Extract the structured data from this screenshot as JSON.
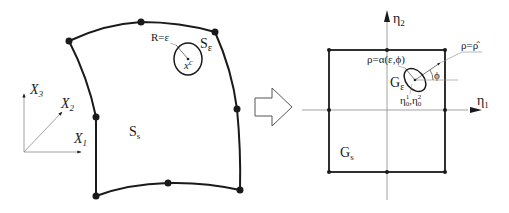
{
  "diagram": {
    "left_panel": {
      "name": "physical-surface",
      "surface_label": {
        "main": "S",
        "sub": "s"
      },
      "singular_region_label": {
        "main": "S",
        "sub": "ε"
      },
      "radius_label": "R=ε",
      "source_point_label": {
        "main": "x",
        "sup": "c"
      },
      "axes": {
        "x1": {
          "main": "X",
          "sub": "1"
        },
        "x2": {
          "main": "X",
          "sub": "2"
        },
        "x3": {
          "main": "X",
          "sub": "3"
        }
      },
      "node_count": 8
    },
    "transform_arrow": {
      "name": "mapping-arrow"
    },
    "right_panel": {
      "name": "parametric-square",
      "axis_h": {
        "main": "η",
        "sub": "1"
      },
      "axis_v": {
        "main": "η",
        "sub": "2"
      },
      "square_label": {
        "main": "G",
        "sub": "s"
      },
      "singular_region_label": {
        "main": "G",
        "sub": "ε"
      },
      "rho_alpha_label": "ρ=α(ε,ϕ)",
      "rho_hat_label": "ρ=ρ̂",
      "phi_label": "ϕ",
      "center_label": {
        "a_main": "η",
        "a_sub": "0",
        "a_sup": "1",
        "b_main": "η",
        "b_sub": "0",
        "b_sup": "2"
      },
      "node_count": 8
    },
    "colors": {
      "stroke": "#1a1a1a",
      "thin_line": "#8a8a8a",
      "background": "#ffffff"
    }
  }
}
